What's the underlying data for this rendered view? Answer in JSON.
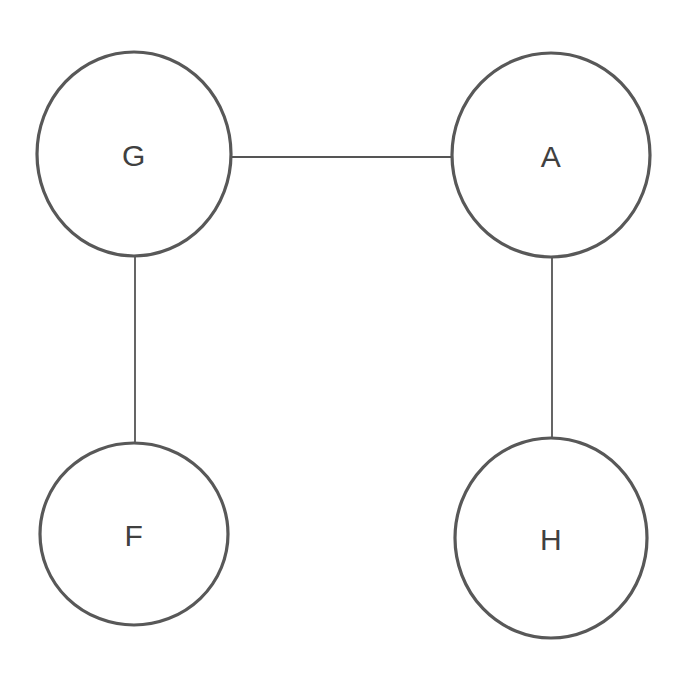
{
  "diagram": {
    "type": "graph",
    "title": "",
    "background_color": "#ffffff",
    "node_stroke_color": "#585858",
    "node_fill_color": "#ffffff",
    "node_stroke_width": 3.2,
    "edge_color": "#555555",
    "edge_stroke_width": 1.8,
    "label_color": "#404040",
    "label_font_size": 30,
    "canvas": {
      "width": 690,
      "height": 693
    },
    "nodes": [
      {
        "id": "G",
        "label": "G",
        "cx": 134,
        "cy": 154,
        "rx": 97,
        "ry": 102
      },
      {
        "id": "A",
        "label": "A",
        "cx": 551,
        "cy": 155,
        "rx": 99,
        "ry": 102
      },
      {
        "id": "F",
        "label": "F",
        "cx": 134,
        "cy": 534,
        "rx": 94,
        "ry": 91
      },
      {
        "id": "H",
        "label": "H",
        "cx": 551,
        "cy": 538,
        "rx": 96,
        "ry": 100
      }
    ],
    "edges": [
      {
        "id": "G-A",
        "source": "G",
        "target": "A",
        "x1": 231,
        "y1": 157,
        "x2": 452,
        "y2": 157
      },
      {
        "id": "G-F",
        "source": "G",
        "target": "F",
        "x1": 135,
        "y1": 256,
        "x2": 135,
        "y2": 443
      },
      {
        "id": "A-H",
        "source": "A",
        "target": "H",
        "x1": 552,
        "y1": 257,
        "x2": 552,
        "y2": 438
      }
    ]
  }
}
